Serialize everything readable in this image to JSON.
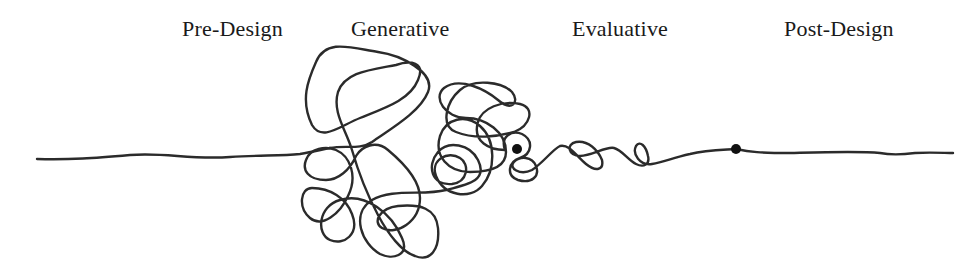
{
  "diagram": {
    "type": "design-squiggle",
    "phases": [
      {
        "label": "Pre-Design"
      },
      {
        "label": "Generative"
      },
      {
        "label": "Evaluative"
      },
      {
        "label": "Post-Design"
      }
    ],
    "markers": [
      {
        "name": "start-of-evaluative-marker",
        "x": 517,
        "y": 149
      },
      {
        "name": "start-of-post-design-marker",
        "x": 736,
        "y": 149
      }
    ],
    "colors": {
      "line": "#2b2b2b",
      "text": "#1a1a1a",
      "background": "#ffffff"
    }
  }
}
